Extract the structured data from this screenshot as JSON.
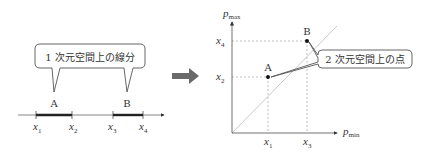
{
  "left_panel": {
    "callout_text": "1 次元空間上の線分",
    "segment_a_label": "A",
    "segment_b_label": "B",
    "ticks": {
      "x1": "x",
      "x1_sub": "1",
      "x2": "x",
      "x2_sub": "2",
      "x3": "x",
      "x3_sub": "3",
      "x4": "x",
      "x4_sub": "4"
    }
  },
  "transform_arrow": {
    "icon": "right-arrow-icon"
  },
  "right_panel": {
    "y_axis_label": "p",
    "y_axis_sub": "max",
    "x_axis_label": "p",
    "x_axis_sub": "min",
    "point_a_label": "A",
    "point_b_label": "B",
    "callout_text": "2 次元空間上の点",
    "y_ticks": {
      "x4": "x",
      "x4_sub": "4",
      "x2": "x",
      "x2_sub": "2"
    },
    "x_ticks": {
      "x1": "x",
      "x1_sub": "1",
      "x3": "x",
      "x3_sub": "3"
    }
  },
  "colors": {
    "line": "#333333",
    "guide": "#999999",
    "diagonal": "#b0b0b0",
    "arrow": "#666666",
    "callout_border": "#555555"
  }
}
